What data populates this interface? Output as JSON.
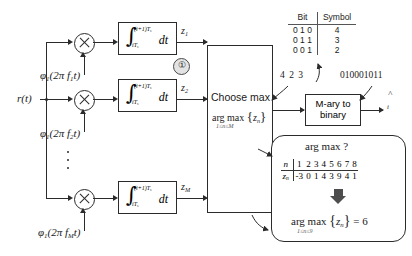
{
  "diagram": {
    "input_signal": "r(t)",
    "output_signal": "b",
    "output_hat": "^",
    "output_sub": "i"
  },
  "branches": [
    {
      "carrier": "φ",
      "carrier_sub": "1",
      "carrier_arg": "(2π f",
      "carrier_arg_sub": "1",
      "carrier_arg_end": "t)",
      "integral_upper": "(i+1)T",
      "integral_upper_sub": "s",
      "integral_lower": "iT",
      "integral_lower_sub": "s",
      "integral_dt": "dt",
      "output": "z",
      "output_sub": "1"
    },
    {
      "carrier": "φ",
      "carrier_sub": "1",
      "carrier_arg": "(2π f",
      "carrier_arg_sub": "2",
      "carrier_arg_end": "t)",
      "integral_upper": "(i+1)T",
      "integral_upper_sub": "s",
      "integral_lower": "iT",
      "integral_lower_sub": "s",
      "integral_dt": "dt",
      "output": "z",
      "output_sub": "2"
    },
    {
      "carrier": "φ",
      "carrier_sub": "1",
      "carrier_arg": "(2π f",
      "carrier_arg_sub": "M",
      "carrier_arg_end": "t)",
      "integral_upper": "(i+1)T",
      "integral_upper_sub": "s",
      "integral_lower": "iT",
      "integral_lower_sub": "s",
      "integral_dt": "dt",
      "output": "z",
      "output_sub": "M"
    }
  ],
  "step_markers": {
    "one": "①",
    "two": "②"
  },
  "choose_max": {
    "line1": "Choose max",
    "argmax": "arg max",
    "brace_open": "{",
    "var": "z",
    "var_sub": "n",
    "brace_close": "}",
    "range": "1≤n≤M"
  },
  "mary_box": {
    "line1": "M-ary to",
    "line2": "binary"
  },
  "bit_table": {
    "headers": [
      "Bit",
      "Symbol"
    ],
    "rows": [
      {
        "bit": "0 1 0",
        "symbol": "4"
      },
      {
        "bit": "0 1 1",
        "symbol": "3"
      },
      {
        "bit": "0 0 1",
        "symbol": "2"
      }
    ]
  },
  "symbol_stream": "4 2 3",
  "bit_stream": "010001011",
  "argmax_callout": {
    "title": "arg max ?",
    "row_n_label": "n",
    "row_z_label": "z",
    "row_z_label_sub": "n",
    "n_values": [
      "1",
      "2",
      "3",
      "4",
      "5",
      "6",
      "7",
      "8"
    ],
    "z_values": [
      "-3",
      "0",
      "1",
      "4",
      "3",
      "9",
      "4",
      "1"
    ],
    "result_argmax": "arg max",
    "result_brace_open": "{",
    "result_var": "z",
    "result_var_sub": "n",
    "result_brace_close": "}",
    "result_equals": "= 6",
    "result_range": "1≤n≤9"
  },
  "colors": {
    "line": "#2b2b2b",
    "step_fill": "#e3e3e3",
    "arrow_fill": "#4d4d4d",
    "text": "#1a1a1a"
  }
}
